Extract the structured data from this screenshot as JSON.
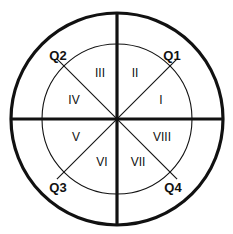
{
  "figure": {
    "type": "circle-sector-diagram",
    "background_color": "#ffffff",
    "stroke_color": "#111111",
    "geometry": {
      "center_x": 117,
      "center_y": 119,
      "outer_radius": 106,
      "inner_radius": 75,
      "diagonal_extent": 85,
      "outer_stroke_width": 3.2,
      "axis_stroke_width": 3.2,
      "inner_stroke_width": 1.1,
      "diagonal_stroke_width": 1.1
    }
  },
  "quadrant_labels": [
    {
      "text": "Q1",
      "x": 172,
      "y": 55
    },
    {
      "text": "Q2",
      "x": 58,
      "y": 55
    },
    {
      "text": "Q3",
      "x": 58,
      "y": 187
    },
    {
      "text": "Q4",
      "x": 173,
      "y": 187
    }
  ],
  "sector_labels": [
    {
      "text": "I",
      "x": 161,
      "y": 100
    },
    {
      "text": "II",
      "x": 135,
      "y": 73
    },
    {
      "text": "III",
      "x": 100,
      "y": 73
    },
    {
      "text": "IV",
      "x": 74,
      "y": 100
    },
    {
      "text": "V",
      "x": 76,
      "y": 137
    },
    {
      "text": "VI",
      "x": 102,
      "y": 162
    },
    {
      "text": "VII",
      "x": 138,
      "y": 162
    },
    {
      "text": "VIII",
      "x": 162,
      "y": 137
    }
  ]
}
